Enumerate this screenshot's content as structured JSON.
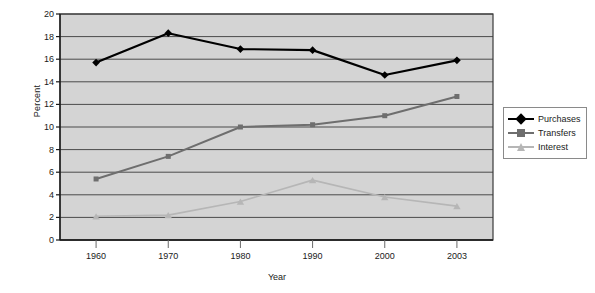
{
  "chart_data": {
    "type": "line",
    "title": "",
    "xlabel": "Year",
    "ylabel": "Percent",
    "categories": [
      "1960",
      "1970",
      "1980",
      "1990",
      "2000",
      "2003"
    ],
    "x": [
      1960,
      1970,
      1980,
      1990,
      2000,
      2003
    ],
    "ylim": [
      0,
      20
    ],
    "ytick_step": 2,
    "yticks": [
      "20",
      "18",
      "16",
      "14",
      "12",
      "10",
      "8",
      "6",
      "4",
      "2",
      "0"
    ],
    "grid": "horizontal",
    "legend_position": "right",
    "plot_background": "#d4d4d4",
    "series": [
      {
        "name": "Purchases",
        "color": "#000000",
        "marker": "diamond",
        "values": [
          15.7,
          18.3,
          16.9,
          16.8,
          14.6,
          15.9
        ]
      },
      {
        "name": "Transfers",
        "color": "#6e6e6e",
        "marker": "square",
        "values": [
          5.4,
          7.4,
          10.0,
          10.2,
          11.0,
          12.7
        ]
      },
      {
        "name": "Interest",
        "color": "#b6b6b6",
        "marker": "triangle",
        "values": [
          2.1,
          2.2,
          3.4,
          5.3,
          3.8,
          3.0
        ]
      }
    ]
  },
  "legend": {
    "items": [
      {
        "label": "Purchases"
      },
      {
        "label": "Transfers"
      },
      {
        "label": "Interest"
      }
    ]
  },
  "axes": {
    "y_title": "Percent",
    "x_title": "Year"
  }
}
